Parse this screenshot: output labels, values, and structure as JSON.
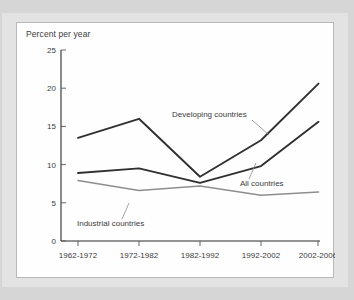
{
  "chart_data": {
    "type": "line",
    "title": "Percent per year",
    "xlabel": "",
    "ylabel": "Percent per year",
    "categories": [
      "1962-1972",
      "1972-1982",
      "1982-1992",
      "1992-2002",
      "2002-2006"
    ],
    "ylim": [
      0,
      25
    ],
    "yticks": [
      "0",
      "5",
      "10",
      "15",
      "20",
      "25"
    ],
    "grid": false,
    "legend_position": "inline-annotations",
    "series": [
      {
        "name": "Developing countries",
        "color": "#303030",
        "values": [
          13.5,
          16.0,
          8.4,
          13.2,
          20.6
        ]
      },
      {
        "name": "All countries",
        "color": "#303030",
        "values": [
          8.9,
          9.5,
          7.6,
          9.8,
          15.6
        ]
      },
      {
        "name": "Industrial countries",
        "color": "#8e8e8e",
        "values": [
          7.9,
          6.6,
          7.2,
          6.0,
          6.4
        ]
      }
    ],
    "annotations": [
      {
        "text": "Developing countries",
        "series": "Developing countries"
      },
      {
        "text": "All countries",
        "series": "All countries"
      },
      {
        "text": "Industrial countries",
        "series": "Industrial countries"
      }
    ]
  },
  "ticks": {
    "y": [
      "25",
      "20",
      "15",
      "10",
      "5",
      "0"
    ],
    "x": [
      "1962-1972",
      "1972-1982",
      "1982-1992",
      "1992-2002",
      "2002-2006"
    ]
  },
  "labels": {
    "title": "Percent per year",
    "developing": "Developing countries",
    "all": "All countries",
    "industrial": "Industrial countries"
  }
}
